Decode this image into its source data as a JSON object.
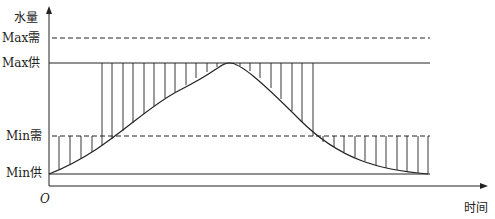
{
  "diagram": {
    "y_axis_label": "水量",
    "x_axis_label": "时间",
    "origin_label": "O",
    "levels": {
      "max_demand": "Max需",
      "max_supply": "Max供",
      "min_demand": "Min需",
      "min_supply": "Min供"
    },
    "colors": {
      "line": "#222222",
      "background": "#ffffff"
    }
  }
}
